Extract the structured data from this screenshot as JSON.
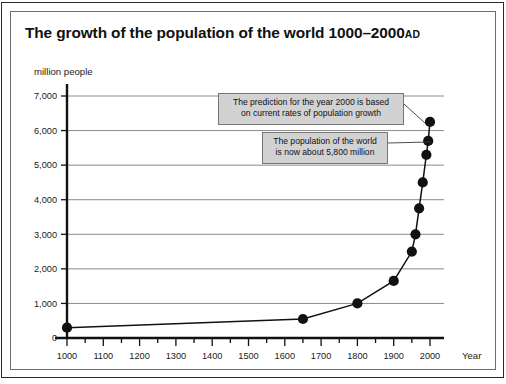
{
  "figure": {
    "title_main": "The growth of the population of the world 1000–2000",
    "title_suffix": "AD",
    "y_axis_label": "million people",
    "x_axis_label": "Year"
  },
  "annotations": [
    {
      "id": "prediction",
      "text": "The prediction for the year 2000 is based\non current rates of population growth",
      "anchor_year": 2000,
      "anchor_value": 6250
    },
    {
      "id": "current",
      "text": "The population of the world\nis now about 5,800 million",
      "anchor_year": 1995,
      "anchor_value": 5700
    }
  ],
  "colors": {
    "marker": "#111111",
    "line": "#111111",
    "gridline": "#8a8a8a",
    "callout_fill": "#d2d2d2",
    "callout_border": "#767676",
    "frame": "#2b2b2b"
  },
  "chart_data": {
    "type": "line",
    "xlabel": "Year",
    "ylabel": "million people",
    "xlim": [
      1000,
      2000
    ],
    "ylim": [
      0,
      7000
    ],
    "xticks": [
      1000,
      1100,
      1200,
      1300,
      1400,
      1500,
      1600,
      1700,
      1800,
      1900,
      2000
    ],
    "xtick_labels": [
      "1000",
      "1100",
      "1200",
      "1300",
      "1400",
      "1500",
      "1600",
      "1700",
      "1800",
      "1900",
      "2000"
    ],
    "yticks": [
      0,
      1000,
      2000,
      3000,
      4000,
      5000,
      6000,
      7000
    ],
    "ytick_labels": [
      "0",
      "1,000",
      "2,000",
      "3,000",
      "4,000",
      "5,000",
      "6,000",
      "7,000"
    ],
    "grid": "horizontal",
    "legend": "none",
    "series": [
      {
        "name": "World population",
        "x": [
          1000,
          1650,
          1800,
          1900,
          1950,
          1960,
          1970,
          1980,
          1990,
          1995,
          2000
        ],
        "values": [
          300,
          550,
          1000,
          1650,
          2500,
          3000,
          3750,
          4500,
          5300,
          5700,
          6250
        ]
      }
    ]
  }
}
